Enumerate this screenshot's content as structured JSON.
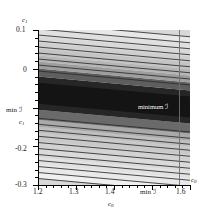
{
  "figure": {
    "type": "contour-density-plot",
    "background": "#ffffff",
    "plot_bg": "#d8d8d8"
  },
  "axes": {
    "x": {
      "label": "c",
      "label_sub": "0",
      "min": 1.2,
      "max": 1.6,
      "tick_labels": [
        "1.2",
        "1.3",
        "1.4",
        "min ℐ",
        "1.6"
      ],
      "tick_values": [
        1.2,
        1.3,
        1.4,
        1.57,
        1.6
      ],
      "minor_tick_step": 0.02
    },
    "y": {
      "label": "c",
      "label_sub": "1",
      "min": -0.3,
      "max": 0.1,
      "tick_labels": [
        "0.1",
        "0",
        "min ℐ",
        "-0.2",
        "-0.3"
      ],
      "tick_values": [
        0.1,
        0.0,
        -0.09,
        -0.2,
        -0.3
      ],
      "minor_tick_step": 0.02
    }
  },
  "annotations": {
    "minimum_marker": "minimum ℐ",
    "minimum_marker_color": "#ffffff",
    "minimum_x_label": "min ℐ",
    "minimum_y_label": "min ℐ"
  },
  "chart_data": {
    "type": "heatmap",
    "title": "",
    "xlabel": "c0",
    "ylabel": "c1",
    "xlim": [
      1.2,
      1.6
    ],
    "ylim": [
      -0.3,
      0.1
    ],
    "grid": false,
    "legend": null,
    "colormap": "grayscale-dark-minimum",
    "minimum_point": {
      "c0": 1.57,
      "c1": -0.09,
      "label": "minimum ℐ"
    },
    "band_slope_deg": 5.2,
    "annotations": [
      "minimum ℐ"
    ],
    "bands": [
      {
        "shade": "#f0f0f0",
        "y_top": -0.3,
        "y_bottom": -0.285
      },
      {
        "shade": "#e9e9e9",
        "y_top": -0.285,
        "y_bottom": -0.265
      },
      {
        "shade": "#e2e2e2",
        "y_top": -0.265,
        "y_bottom": -0.245
      },
      {
        "shade": "#dadada",
        "y_top": -0.245,
        "y_bottom": -0.225
      },
      {
        "shade": "#d2d2d2",
        "y_top": -0.225,
        "y_bottom": -0.205
      },
      {
        "shade": "#c9c9c9",
        "y_top": -0.205,
        "y_bottom": -0.185
      },
      {
        "shade": "#bfbfbf",
        "y_top": -0.185,
        "y_bottom": -0.168
      },
      {
        "shade": "#a9a9a9",
        "y_top": -0.168,
        "y_bottom": -0.15
      },
      {
        "shade": "#6a6a6a",
        "y_top": -0.15,
        "y_bottom": -0.125
      },
      {
        "shade": "#262626",
        "y_top": -0.125,
        "y_bottom": -0.04
      },
      {
        "shade": "#141414",
        "y_top": -0.11,
        "y_bottom": -0.055
      },
      {
        "shade": "#5e5e5e",
        "y_top": -0.04,
        "y_bottom": -0.018
      },
      {
        "shade": "#9e9e9e",
        "y_top": -0.018,
        "y_bottom": 0.0
      },
      {
        "shade": "#b6b6b6",
        "y_top": 0.0,
        "y_bottom": 0.016
      },
      {
        "shade": "#c4c4c4",
        "y_top": 0.016,
        "y_bottom": 0.032
      },
      {
        "shade": "#cfcfcf",
        "y_top": 0.032,
        "y_bottom": 0.048
      },
      {
        "shade": "#d8d8d8",
        "y_top": 0.048,
        "y_bottom": 0.064
      },
      {
        "shade": "#e0e0e0",
        "y_top": 0.064,
        "y_bottom": 0.082
      },
      {
        "shade": "#e8e8e8",
        "y_top": 0.082,
        "y_bottom": 0.1
      }
    ],
    "contour_line_color": "#2b2b2b",
    "contour_line_count": 26
  }
}
